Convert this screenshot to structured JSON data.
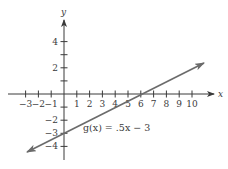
{
  "chart_data": {
    "type": "line",
    "title": "",
    "xlabel": "x",
    "ylabel": "y",
    "xlim": [
      -3.5,
      11
    ],
    "ylim": [
      -5,
      5.5
    ],
    "grid": false,
    "x_ticks": [
      -3,
      -2,
      -1,
      1,
      2,
      3,
      4,
      5,
      6,
      7,
      8,
      9,
      10
    ],
    "x_tick_labels": [
      "−3",
      "−2",
      "−1",
      "1",
      "2",
      "3",
      "4",
      "5",
      "6",
      "7",
      "8",
      "9",
      "10"
    ],
    "y_ticks": [
      -4,
      -3,
      -2,
      -1,
      1,
      2,
      3,
      4
    ],
    "y_tick_labels": {
      "4": "4",
      "2": "2",
      "-2": "−2",
      "-3": "−3",
      "-4": "−4"
    },
    "series": [
      {
        "name": "g(x) = .5x − 3",
        "function": "0.5*x - 3",
        "x": [
          -3,
          0,
          6,
          11
        ],
        "values": [
          -4.5,
          -3,
          0,
          2.5
        ],
        "color": "#6b6b6b",
        "arrows": "both"
      }
    ],
    "annotations": [
      {
        "text": "g(x) = .5x − 3",
        "x": 1.5,
        "y": -2.6
      }
    ],
    "intercepts": {
      "x_intercept": 6,
      "y_intercept": -3
    }
  },
  "labels": {
    "x_axis": "x",
    "y_axis": "y",
    "function": "g(x) = .5x − 3"
  },
  "colors": {
    "axis": "#3a3a3a",
    "line": "#6b6b6b",
    "text": "#3a3a3a",
    "background": "#ffffff"
  }
}
